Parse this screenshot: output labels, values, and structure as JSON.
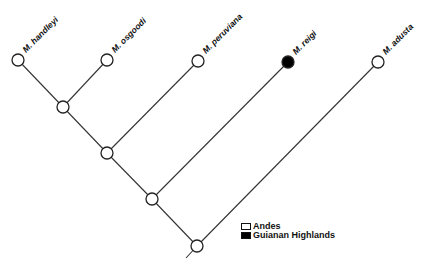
{
  "diagram": {
    "type": "phylogenetic-tree",
    "colors": {
      "andes": "#ffffff",
      "guianan_highlands": "#000000",
      "line": "#333333"
    },
    "taxa": [
      {
        "label": "M. handleyi",
        "region": "Andes"
      },
      {
        "label": "M. osgoodi",
        "region": "Andes"
      },
      {
        "label": "M. peruviana",
        "region": "Andes"
      },
      {
        "label": "M. reigi",
        "region": "Guianan Highlands"
      },
      {
        "label": "M. adusta",
        "region": "Andes"
      }
    ],
    "internal_nodes": [
      {
        "id": "n1",
        "region": "Andes"
      },
      {
        "id": "n2",
        "region": "Andes"
      },
      {
        "id": "n3",
        "region": "Andes"
      },
      {
        "id": "root",
        "region": "Andes"
      }
    ]
  },
  "legend": {
    "items": [
      {
        "label": "Andes",
        "fill": "#ffffff"
      },
      {
        "label": "Guianan Highlands",
        "fill": "#000000"
      }
    ]
  }
}
